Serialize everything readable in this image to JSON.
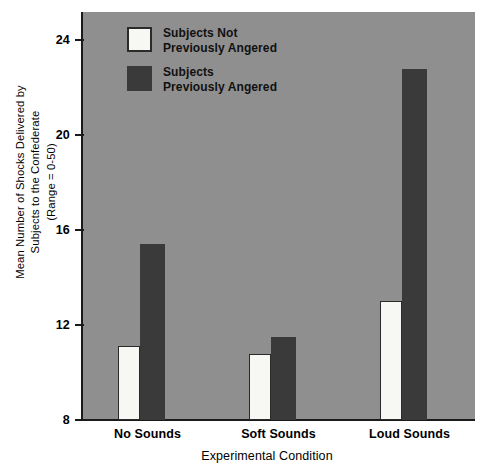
{
  "chart_data": {
    "type": "bar",
    "title": "",
    "xlabel": "Experimental Condition",
    "ylabel": "Mean Number of Shocks Delivered by Subjects to the Confederate (Range = 0-50)",
    "ylabel_lines": [
      "Mean Number of Shocks Delivered by",
      "Subjects to the Confederate",
      "(Range = 0-50)"
    ],
    "categories": [
      "No Sounds",
      "Soft Sounds",
      "Loud Sounds"
    ],
    "series": [
      {
        "name": "Subjects Not Previously Angered",
        "color": "#f7f7f4",
        "values": [
          11.1,
          10.8,
          13.0
        ]
      },
      {
        "name": "Subjects Previously Angered",
        "color": "#3a3a3a",
        "values": [
          15.4,
          11.5,
          22.8
        ]
      }
    ],
    "ylim": [
      8,
      25.2
    ],
    "yticks": [
      8,
      12,
      16,
      20,
      24
    ],
    "ytick_labels": [
      "8",
      "12",
      "16",
      "20",
      "24"
    ],
    "grid": false,
    "legend_position": "top-left",
    "plot_background": "#8f8f8f",
    "axis_color": "#1a1a1a"
  },
  "legend": {
    "entries": [
      {
        "label": "Subjects Not\nPreviously Angered",
        "swatch": "light"
      },
      {
        "label": "Subjects\nPreviously Angered",
        "swatch": "dark"
      }
    ]
  }
}
